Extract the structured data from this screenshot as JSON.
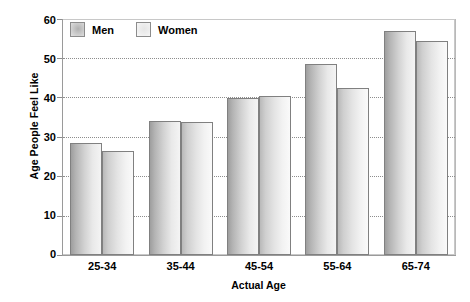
{
  "chart_data": {
    "type": "bar",
    "title": "",
    "xlabel": "Actual Age",
    "ylabel": "Age People Feel Like",
    "categories": [
      "25-34",
      "35-44",
      "45-54",
      "55-64",
      "65-74"
    ],
    "series": [
      {
        "name": "Men",
        "values": [
          28.5,
          34.0,
          40.0,
          48.5,
          57.0
        ],
        "color": "#cccccc"
      },
      {
        "name": "Women",
        "values": [
          26.5,
          33.8,
          40.5,
          42.5,
          54.5
        ],
        "color": "#e8e8e8"
      }
    ],
    "ylim": [
      0,
      60
    ],
    "yticks": [
      0,
      10,
      20,
      30,
      40,
      50,
      60
    ],
    "ytick_labels": [
      "0",
      "10",
      "20",
      "30",
      "40",
      "50",
      "60"
    ],
    "grid": true,
    "grid_axis": "y",
    "legend_position": "top-left",
    "bar_border_color": "#808080",
    "grid_color": "#8d8d8d",
    "frame_color": "#9a9a9a",
    "background": "#ffffff"
  },
  "legend": {
    "entries": [
      {
        "label": "Men",
        "swatch": "men-swatch-icon"
      },
      {
        "label": "Women",
        "swatch": "women-swatch-icon"
      }
    ]
  },
  "axes": {
    "y_title": "Age People Feel Like",
    "x_title": "Actual Age",
    "y_labels": [
      "60",
      "50",
      "40",
      "30",
      "20",
      "10",
      "0"
    ],
    "x_labels": [
      "25-34",
      "35-44",
      "45-54",
      "55-64",
      "65-74"
    ]
  }
}
